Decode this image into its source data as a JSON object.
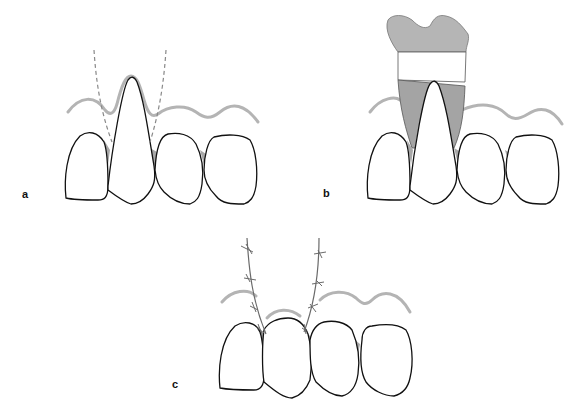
{
  "figure": {
    "panels": [
      {
        "id": "a",
        "label": "a",
        "description": "Dashed incision lines outlining flap around exposed root of tooth"
      },
      {
        "id": "b",
        "label": "b",
        "description": "Graft tissue (gray) with white band placed over exposed root"
      },
      {
        "id": "c",
        "label": "c",
        "description": "Sutured flaps covering the root with interrupted sutures"
      }
    ],
    "colors": {
      "gingiva_line": "#b4b4b4",
      "graft_gray": "#a9a9a9",
      "tooth_outline": "#111111",
      "incision_dash": "#888888",
      "suture": "#6a6a6a",
      "background": "#ffffff"
    }
  }
}
